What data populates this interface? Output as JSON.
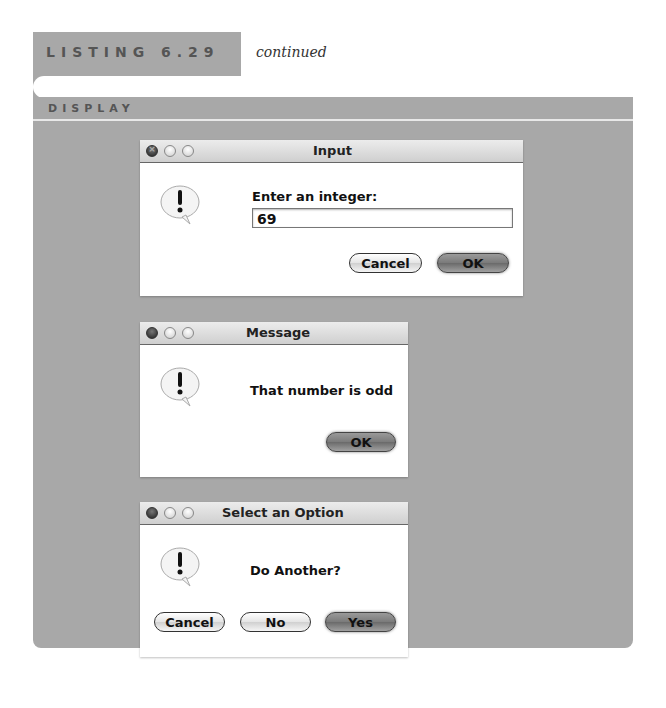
{
  "listing": {
    "label": "LISTING 6.29",
    "continued": "continued"
  },
  "section": {
    "label": "DISPLAY"
  },
  "dialogs": {
    "input": {
      "title": "Input",
      "prompt": "Enter an integer:",
      "value": "69",
      "buttons": {
        "cancel": "Cancel",
        "ok": "OK"
      }
    },
    "message": {
      "title": "Message",
      "text": "That number is odd",
      "buttons": {
        "ok": "OK"
      }
    },
    "option": {
      "title": "Select an Option",
      "text": "Do Another?",
      "buttons": {
        "cancel": "Cancel",
        "no": "No",
        "yes": "Yes"
      }
    }
  },
  "icons": {
    "alert": "exclamation-speech-bubble-icon",
    "close": "close-icon",
    "minimize": "minimize-icon",
    "zoom": "zoom-icon"
  },
  "colors": {
    "panel": "#a8a8a8",
    "dialog_bg": "#ffffff",
    "label_text": "#555555"
  }
}
